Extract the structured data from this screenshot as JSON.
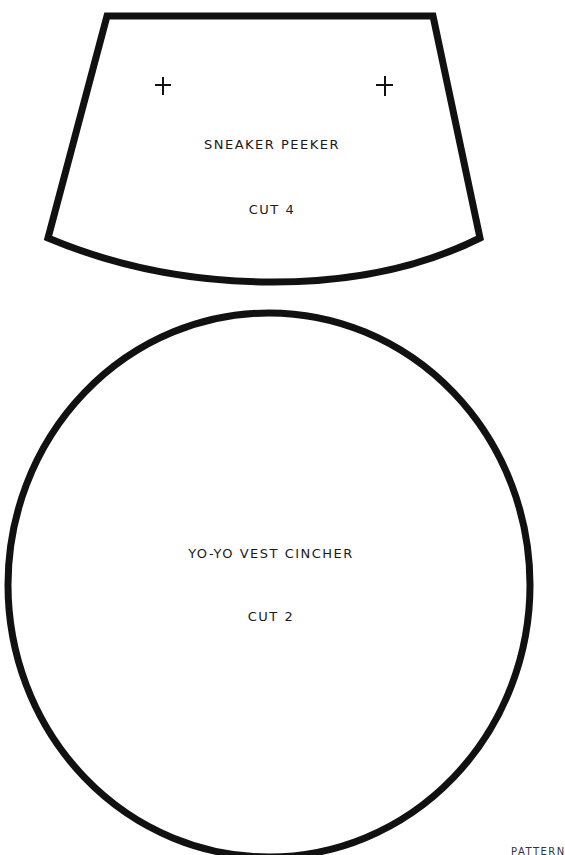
{
  "pieces": [
    {
      "name": "Sneaker Peeker",
      "title": "SNEAKER PEEKER",
      "instruction": "CUT 4",
      "shape": "trapezoid-with-curved-bottom",
      "marks": [
        "plus-mark",
        "plus-mark"
      ]
    },
    {
      "name": "Yo-Yo Vest Cincher",
      "title": "YO-YO VEST CINCHER",
      "instruction": "CUT 2",
      "shape": "circle"
    }
  ],
  "footer": "PATTERN",
  "colors": {
    "outline": "#111111",
    "text": "#1a1a1a",
    "background": "#ffffff"
  }
}
